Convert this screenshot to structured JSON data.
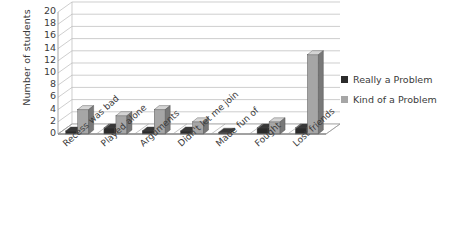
{
  "chart_data": {
    "type": "bar",
    "title": "",
    "subtitle": "",
    "xlabel": "",
    "ylabel": "Number of students",
    "ylim": [
      0,
      20
    ],
    "ytick_step": 2,
    "yticks": [
      20,
      18,
      16,
      14,
      12,
      10,
      8,
      6,
      4,
      2,
      0
    ],
    "grid": true,
    "legend_position": "right",
    "style_note": "3D perspective column chart",
    "categories": [
      "Recess was bad",
      "Played alone",
      "Arguments",
      "Didn't let me join",
      "Made fun of",
      "Fought",
      "Lost friends"
    ],
    "series": [
      {
        "name": "Really a Problem",
        "color": "#2b2b2b",
        "values": [
          0.5,
          1,
          0.5,
          0.5,
          0.3,
          1,
          1
        ]
      },
      {
        "name": "Kind of a Problem",
        "color": "#a6a6a6",
        "values": [
          4,
          3,
          4,
          2,
          0,
          2,
          13
        ]
      }
    ]
  },
  "axis": {
    "y_title": "Number of students"
  },
  "legend": {
    "items": [
      {
        "label": "Really a Problem",
        "color": "#2b2b2b"
      },
      {
        "label": "Kind of a Problem",
        "color": "#a6a6a6"
      }
    ]
  }
}
